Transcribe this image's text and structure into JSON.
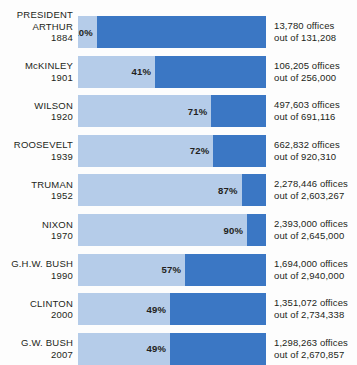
{
  "chart_header": "PRESIDENT",
  "colors": {
    "bar_remaining": "#3b77c4",
    "bar_filled": "#b5cce9",
    "background": "#fdfdfd",
    "text": "#231f20"
  },
  "chart_data": {
    "type": "bar",
    "title": "PRESIDENT",
    "xlabel": "",
    "ylabel": "",
    "xlim": [
      0,
      100
    ],
    "grid": false,
    "legend": "none",
    "orientation": "horizontal",
    "units": "percent",
    "categories": [
      "ARTHUR 1884",
      "McKINLEY 1901",
      "WILSON 1920",
      "ROOSEVELT 1939",
      "TRUMAN 1952",
      "NIXON 1970",
      "G.H.W. BUSH 1990",
      "CLINTON 2000",
      "G.W. BUSH 2007"
    ],
    "values": [
      10,
      41,
      71,
      72,
      87,
      90,
      57,
      49,
      49
    ],
    "rows": [
      {
        "president": "ARTHUR",
        "year": "1884",
        "percent": 10,
        "percent_label": "10%",
        "value_line1": "13,780 offices",
        "value_line2": "out of 131,208",
        "offices": 13780,
        "total_offices": 131208
      },
      {
        "president": "McKINLEY",
        "year": "1901",
        "percent": 41,
        "percent_label": "41%",
        "value_line1": "106,205 offices",
        "value_line2": "out of 256,000",
        "offices": 106205,
        "total_offices": 256000
      },
      {
        "president": "WILSON",
        "year": "1920",
        "percent": 71,
        "percent_label": "71%",
        "value_line1": "497,603 offices",
        "value_line2": "out of 691,116",
        "offices": 497603,
        "total_offices": 691116
      },
      {
        "president": "ROOSEVELT",
        "year": "1939",
        "percent": 72,
        "percent_label": "72%",
        "value_line1": "662,832 offices",
        "value_line2": "out of 920,310",
        "offices": 662832,
        "total_offices": 920310
      },
      {
        "president": "TRUMAN",
        "year": "1952",
        "percent": 87,
        "percent_label": "87%",
        "value_line1": "2,278,446 offices",
        "value_line2": "out of 2,603,267",
        "offices": 2278446,
        "total_offices": 2603267
      },
      {
        "president": "NIXON",
        "year": "1970",
        "percent": 90,
        "percent_label": "90%",
        "value_line1": "2,393,000 offices",
        "value_line2": "out of 2,645,000",
        "offices": 2393000,
        "total_offices": 2645000
      },
      {
        "president": "G.H.W. BUSH",
        "year": "1990",
        "percent": 57,
        "percent_label": "57%",
        "value_line1": "1,694,000 offices",
        "value_line2": "out of 2,940,000",
        "offices": 1694000,
        "total_offices": 2940000
      },
      {
        "president": "CLINTON",
        "year": "2000",
        "percent": 49,
        "percent_label": "49%",
        "value_line1": "1,351,072 offices",
        "value_line2": "out of 2,734,338",
        "offices": 1351072,
        "total_offices": 2734338
      },
      {
        "president": "G.W. BUSH",
        "year": "2007",
        "percent": 49,
        "percent_label": "49%",
        "value_line1": "1,298,263 offices",
        "value_line2": "out of 2,670,857",
        "offices": 1298263,
        "total_offices": 2670857
      }
    ]
  }
}
